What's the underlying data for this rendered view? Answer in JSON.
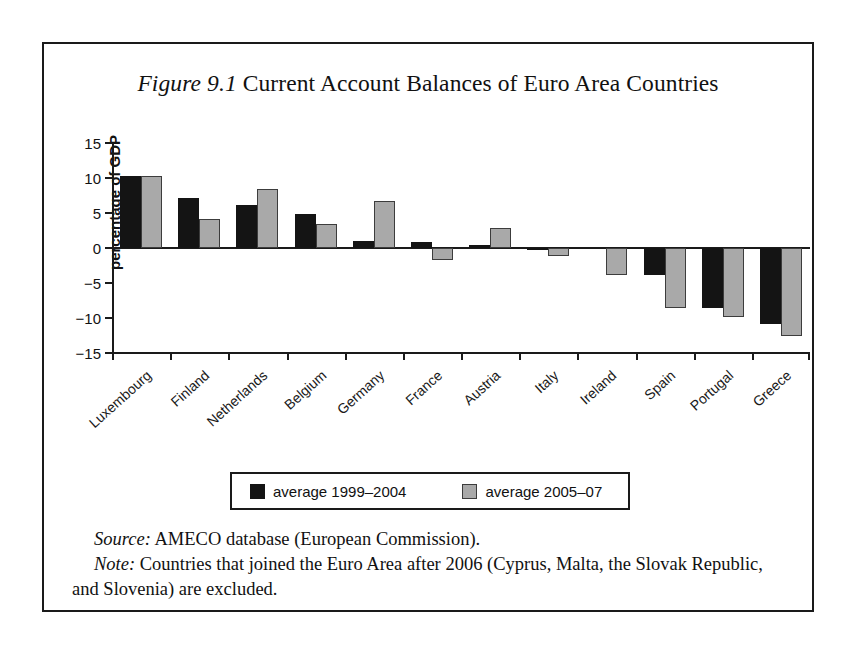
{
  "figure": {
    "label": "Figure 9.1",
    "title": "Current Account Balances of Euro Area Countries"
  },
  "caption": {
    "source_lead": "Source:",
    "source_text": " AMECO database (European Commission).",
    "note_lead": "Note:",
    "note_text": " Countries that joined the Euro Area after 2006 (Cyprus, Malta, the Slovak Republic, and Slovenia) are excluded."
  },
  "legend": {
    "position": "bottom-center",
    "entries": [
      {
        "label": "average 1999–2004",
        "color": "#141414"
      },
      {
        "label": "average 2005–07",
        "color": "#a9a9a9"
      }
    ]
  },
  "chart_data": {
    "type": "bar",
    "title": "Current Account Balances of Euro Area Countries",
    "xlabel": "",
    "ylabel": "percentage of GDP",
    "ylim": [
      -15,
      15
    ],
    "yticks": [
      15,
      10,
      5,
      0,
      -5,
      -10,
      -15
    ],
    "ytick_labels": [
      "15",
      "10",
      "5",
      "0",
      "−5",
      "−10",
      "−15"
    ],
    "grid": false,
    "categories": [
      "Luxembourg",
      "Finland",
      "Netherlands",
      "Belgium",
      "Germany",
      "France",
      "Austria",
      "Italy",
      "Ireland",
      "Spain",
      "Portugal",
      "Greece"
    ],
    "series": [
      {
        "name": "average 1999–2004",
        "color": "#141414",
        "values": [
          10.3,
          7.2,
          6.1,
          4.9,
          1.0,
          0.9,
          0.4,
          -0.1,
          0.0,
          -3.9,
          -8.6,
          -10.9
        ]
      },
      {
        "name": "average 2005–07",
        "color": "#a9a9a9",
        "values": [
          10.3,
          4.2,
          8.4,
          3.4,
          6.7,
          -1.7,
          2.9,
          -1.2,
          -3.9,
          -8.6,
          -9.9,
          -12.6
        ]
      }
    ]
  }
}
